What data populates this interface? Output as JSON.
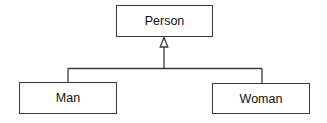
{
  "diagram": {
    "type": "uml-class-inheritance",
    "classes": [
      {
        "id": "person",
        "label": "Person",
        "role": "superclass"
      },
      {
        "id": "man",
        "label": "Man",
        "role": "subclass"
      },
      {
        "id": "woman",
        "label": "Woman",
        "role": "subclass"
      }
    ],
    "relationships": [
      {
        "from": "man",
        "to": "person",
        "kind": "generalization"
      },
      {
        "from": "woman",
        "to": "person",
        "kind": "generalization"
      }
    ],
    "colors": {
      "line": "#3a3a3a",
      "background": "#ffffff",
      "text": "#111111"
    }
  }
}
